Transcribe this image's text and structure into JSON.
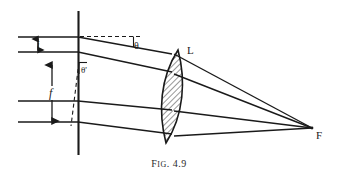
{
  "figure": {
    "caption_prefix": "F",
    "caption_smallcaps": "IG",
    "caption_suffix": ". 4.9",
    "caption_full": "Fig. 4.9",
    "ink_color": "#1a1a1a",
    "background_color": "#ffffff"
  },
  "labels": {
    "lens": "L",
    "focus": "F",
    "theta": "θ",
    "theta_prime": "θ'",
    "image_height": "i",
    "focal_length": "f"
  },
  "diagram": {
    "type": "optical-ray-diagram",
    "vertical_reference_line": {
      "x": 78,
      "y_top": 11,
      "y_bottom": 155
    },
    "lens": {
      "center_x": 172,
      "top_y": 52,
      "bottom_y": 140,
      "label": "L",
      "hatched": true
    },
    "focus_point": {
      "x": 312,
      "y": 128,
      "label": "F"
    },
    "rays": [
      {
        "name": "ray-1-upper-oblique",
        "x1": 18,
        "y1": 37,
        "x2": 78,
        "y2": 37,
        "x3": 172,
        "y3": 54,
        "x4": 312,
        "y4": 128
      },
      {
        "name": "ray-2-oblique",
        "x1": 18,
        "y1": 52,
        "x2": 78,
        "y2": 52,
        "x3": 172,
        "y3": 72,
        "x4": 312,
        "y4": 128
      },
      {
        "name": "ray-3-axial",
        "x1": 18,
        "y1": 101,
        "x2": 78,
        "y2": 101,
        "x3": 172,
        "y3": 108,
        "x4": 312,
        "y4": 128
      },
      {
        "name": "ray-4-lower-axial",
        "x1": 18,
        "y1": 122,
        "x2": 78,
        "y2": 122,
        "x3": 172,
        "y3": 134,
        "x4": 312,
        "y4": 128
      }
    ],
    "dimension_markers": [
      {
        "name": "image-height-i",
        "label": "i",
        "x": 38,
        "y_top": 37,
        "y_bottom": 52
      },
      {
        "name": "focal-length-f",
        "label": "f",
        "x": 52,
        "y_top": 64,
        "y_bottom": 122
      }
    ],
    "angles": [
      {
        "name": "theta",
        "label": "θ",
        "vertex_x": 78,
        "vertex_y": 37,
        "dashed_ref_to_x": 140
      },
      {
        "name": "theta-prime",
        "label": "θ'",
        "vertex_x": 78,
        "vertex_y": 62,
        "dashed_ref_to_y": 124
      }
    ]
  }
}
